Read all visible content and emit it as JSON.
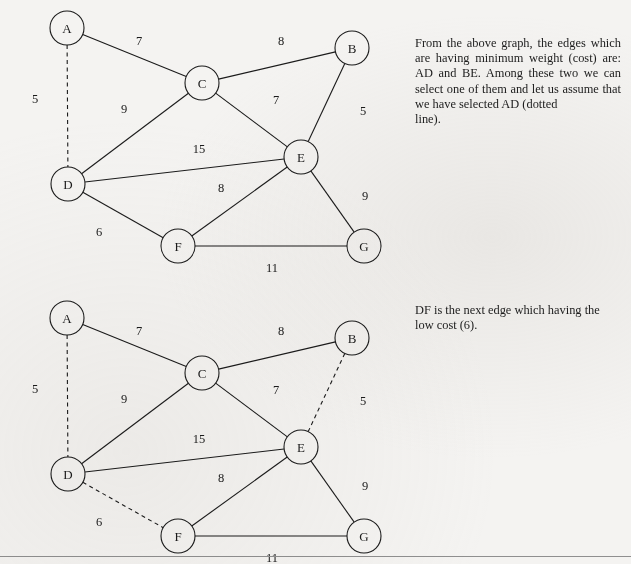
{
  "page": {
    "background_color": "#f4f3f1",
    "ink_color": "#1b1b1b",
    "rule_color": "#8f8f8f"
  },
  "graphs": [
    {
      "id": "graph-1",
      "caption_ref": "note-1",
      "nodes": [
        {
          "id": "A",
          "label": "A",
          "x": 67,
          "y": 28
        },
        {
          "id": "B",
          "label": "B",
          "x": 352,
          "y": 48
        },
        {
          "id": "C",
          "label": "C",
          "x": 202,
          "y": 83
        },
        {
          "id": "D",
          "label": "D",
          "x": 68,
          "y": 184
        },
        {
          "id": "E",
          "label": "E",
          "x": 301,
          "y": 157
        },
        {
          "id": "F",
          "label": "F",
          "x": 178,
          "y": 246
        },
        {
          "id": "G",
          "label": "G",
          "x": 364,
          "y": 246
        }
      ],
      "node_radius": 17,
      "edges": [
        {
          "from": "A",
          "to": "C",
          "weight": "7",
          "style": "solid",
          "lx": 139,
          "ly": 41
        },
        {
          "from": "C",
          "to": "B",
          "weight": "8",
          "style": "solid",
          "lx": 281,
          "ly": 41
        },
        {
          "from": "A",
          "to": "D",
          "weight": "5",
          "style": "dashed",
          "lx": 35,
          "ly": 99
        },
        {
          "from": "C",
          "to": "D",
          "weight": "9",
          "style": "solid",
          "lx": 124,
          "ly": 109
        },
        {
          "from": "C",
          "to": "E",
          "weight": "7",
          "style": "solid",
          "lx": 276,
          "ly": 100
        },
        {
          "from": "B",
          "to": "E",
          "weight": "5",
          "style": "solid",
          "lx": 363,
          "ly": 111
        },
        {
          "from": "D",
          "to": "E",
          "weight": "15",
          "style": "solid",
          "lx": 199,
          "ly": 149
        },
        {
          "from": "F",
          "to": "E",
          "weight": "8",
          "style": "solid",
          "lx": 221,
          "ly": 188
        },
        {
          "from": "D",
          "to": "F",
          "weight": "6",
          "style": "solid",
          "lx": 99,
          "ly": 232
        },
        {
          "from": "E",
          "to": "G",
          "weight": "9",
          "style": "solid",
          "lx": 365,
          "ly": 196
        },
        {
          "from": "F",
          "to": "G",
          "weight": "11",
          "style": "solid",
          "lx": 272,
          "ly": 268
        }
      ]
    },
    {
      "id": "graph-2",
      "caption_ref": "note-2",
      "nodes": [
        {
          "id": "A",
          "label": "A",
          "x": 67,
          "y": 318
        },
        {
          "id": "B",
          "label": "B",
          "x": 352,
          "y": 338
        },
        {
          "id": "C",
          "label": "C",
          "x": 202,
          "y": 373
        },
        {
          "id": "D",
          "label": "D",
          "x": 68,
          "y": 474
        },
        {
          "id": "E",
          "label": "E",
          "x": 301,
          "y": 447
        },
        {
          "id": "F",
          "label": "F",
          "x": 178,
          "y": 536
        },
        {
          "id": "G",
          "label": "G",
          "x": 364,
          "y": 536
        }
      ],
      "node_radius": 17,
      "edges": [
        {
          "from": "A",
          "to": "C",
          "weight": "7",
          "style": "solid",
          "lx": 139,
          "ly": 331
        },
        {
          "from": "C",
          "to": "B",
          "weight": "8",
          "style": "solid",
          "lx": 281,
          "ly": 331
        },
        {
          "from": "A",
          "to": "D",
          "weight": "5",
          "style": "dashed",
          "lx": 35,
          "ly": 389
        },
        {
          "from": "C",
          "to": "D",
          "weight": "9",
          "style": "solid",
          "lx": 124,
          "ly": 399
        },
        {
          "from": "C",
          "to": "E",
          "weight": "7",
          "style": "solid",
          "lx": 276,
          "ly": 390
        },
        {
          "from": "B",
          "to": "E",
          "weight": "5",
          "style": "dashed",
          "lx": 363,
          "ly": 401
        },
        {
          "from": "D",
          "to": "E",
          "weight": "15",
          "style": "solid",
          "lx": 199,
          "ly": 439
        },
        {
          "from": "F",
          "to": "E",
          "weight": "8",
          "style": "solid",
          "lx": 221,
          "ly": 478
        },
        {
          "from": "D",
          "to": "F",
          "weight": "6",
          "style": "dashed",
          "lx": 99,
          "ly": 522
        },
        {
          "from": "E",
          "to": "G",
          "weight": "9",
          "style": "solid",
          "lx": 365,
          "ly": 486
        },
        {
          "from": "F",
          "to": "G",
          "weight": "11",
          "style": "solid",
          "lx": 272,
          "ly": 558
        }
      ]
    }
  ],
  "notes": {
    "note_1": {
      "paragraph_1": "From the above graph, the edges which are having minimum weight (cost) are: AD and BE. Among these two we can select one of them and let us assume that we have selected AD (dotted",
      "paragraph_2": "line)."
    },
    "note_2": {
      "paragraph_1": "DF is the next edge which having the low cost (6).",
      "paragraph_2": ""
    }
  }
}
